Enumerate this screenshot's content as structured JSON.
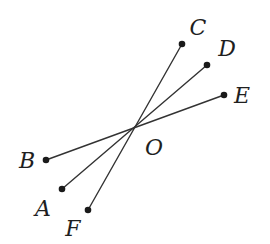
{
  "diagram": {
    "type": "rays-through-point",
    "center": {
      "label": "O",
      "x": 135,
      "y": 127,
      "label_x": 154,
      "label_y": 155
    },
    "points": [
      {
        "id": "C",
        "x": 182,
        "y": 44,
        "label_x": 198,
        "label_y": 35
      },
      {
        "id": "D",
        "x": 207,
        "y": 65,
        "label_x": 227,
        "label_y": 56
      },
      {
        "id": "E",
        "x": 224,
        "y": 95,
        "label_x": 242,
        "label_y": 103
      },
      {
        "id": "B",
        "x": 46,
        "y": 160,
        "label_x": 27,
        "label_y": 168
      },
      {
        "id": "A",
        "x": 62,
        "y": 189,
        "label_x": 43,
        "label_y": 216
      },
      {
        "id": "F",
        "x": 88,
        "y": 210,
        "label_x": 73,
        "label_y": 236
      }
    ],
    "segments": [
      {
        "from": "C",
        "to": "F"
      },
      {
        "from": "D",
        "to": "A"
      },
      {
        "from": "E",
        "to": "B"
      }
    ],
    "labels": {
      "O": "O",
      "A": "A",
      "B": "B",
      "C": "C",
      "D": "D",
      "E": "E",
      "F": "F"
    },
    "colors": {
      "line": "#333333",
      "point": "#1a1a1a",
      "text": "#1f1f1f",
      "background": "#ffffff"
    }
  }
}
